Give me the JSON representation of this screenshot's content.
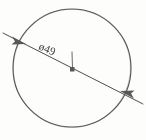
{
  "drawing": {
    "title": "Circle with diameter dimension",
    "background_color": "#fdfdfc",
    "ink_color": "#57585a",
    "text_color": "#3f4042",
    "style": "hand-drawn pencil sketch"
  },
  "dimension": {
    "label": "ø49",
    "symbol": "ø",
    "symbol_name": "diameter-symbol",
    "value": "49",
    "rotation_deg": 23,
    "label_x": 38,
    "label_y": 49
  },
  "circle": {
    "center_x": 72,
    "center_y": 68,
    "radius": 59,
    "name": "circle-outline"
  },
  "leader": {
    "name": "diameter-leader-line",
    "start_x": 3,
    "start_y": 33,
    "end_x": 143,
    "end_y": 104,
    "arrow_start_x": 20,
    "arrow_start_y": 41,
    "arrow_end_x": 126,
    "arrow_end_y": 95,
    "arrow_style": "double-headed"
  },
  "center_mark": {
    "name": "center-mark",
    "tick_x": 72,
    "tick_top_y": 52,
    "tick_bottom_y": 68,
    "dot_x": 72,
    "dot_y": 70,
    "dot_size": 4
  }
}
